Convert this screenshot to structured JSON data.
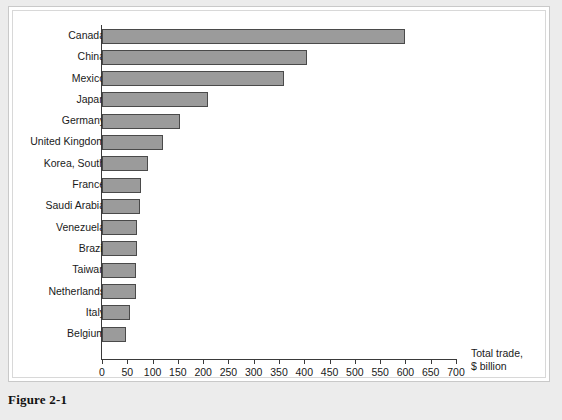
{
  "figure": {
    "caption": "Figure 2-1"
  },
  "chart_data": {
    "type": "bar",
    "orientation": "horizontal",
    "title": "",
    "xlabel": "Total trade, $ billion",
    "xlabel_line1": "Total trade,",
    "xlabel_line2": "$ billion",
    "ylabel": "",
    "xlim": [
      0,
      700
    ],
    "xticks": [
      0,
      50,
      100,
      150,
      200,
      250,
      300,
      350,
      400,
      450,
      500,
      550,
      600,
      650,
      700
    ],
    "grid": false,
    "legend": "none",
    "bar_fill_color": "#9b9b9b",
    "bar_border_color": "#4a4a4a",
    "categories": [
      "Canada",
      "China",
      "Mexico",
      "Japan",
      "Germany",
      "United Kingdom",
      "Korea, South",
      "France",
      "Saudi Arabia",
      "Venezuela",
      "Brazil",
      "Taiwan",
      "Netherlands",
      "Italy",
      "Belgium"
    ],
    "values": [
      600,
      405,
      360,
      210,
      155,
      120,
      90,
      78,
      75,
      70,
      70,
      68,
      68,
      55,
      48
    ]
  }
}
